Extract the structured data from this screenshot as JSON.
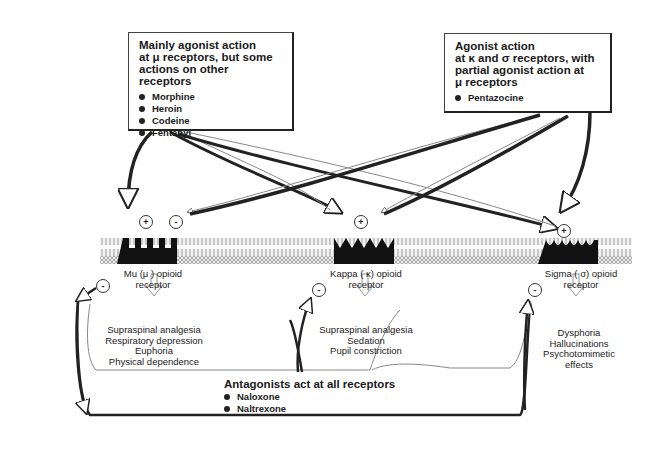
{
  "agonist_box": {
    "title_lines": [
      "Mainly agonist action",
      "at μ receptors, but some",
      "actions on other receptors"
    ],
    "drugs": [
      "Morphine",
      "Heroin",
      "Codeine",
      "Fentanyl"
    ]
  },
  "partial_box": {
    "title_lines": [
      "Agonist action",
      "at κ and σ receptors, with",
      "partial agonist action at",
      "μ receptors"
    ],
    "drugs": [
      "Pentazocine"
    ]
  },
  "receptors": [
    {
      "name_line1": "Mu (μ ) opioid",
      "name_line2": "receptor",
      "effects": [
        "Supraspinal analgesia",
        "Respiratory depression",
        "Euphoria",
        "Physical dependence"
      ]
    },
    {
      "name_line1": "Kappa ( κ) opioid",
      "name_line2": "receptor",
      "effects": [
        "Supraspinal analgesia",
        "Sedation",
        "Pupil constriction"
      ]
    },
    {
      "name_line1": "Sigma ( σ) opioid",
      "name_line2": "receptor",
      "effects": [
        "Dysphoria",
        "Hallucinations",
        "Psychotomimetic",
        "effects"
      ]
    }
  ],
  "signs": {
    "plus": "+",
    "minus": "-"
  },
  "antagonists": {
    "title": "Antagonists act at all receptors",
    "drugs": [
      "Naloxone",
      "Naltrexone"
    ]
  }
}
